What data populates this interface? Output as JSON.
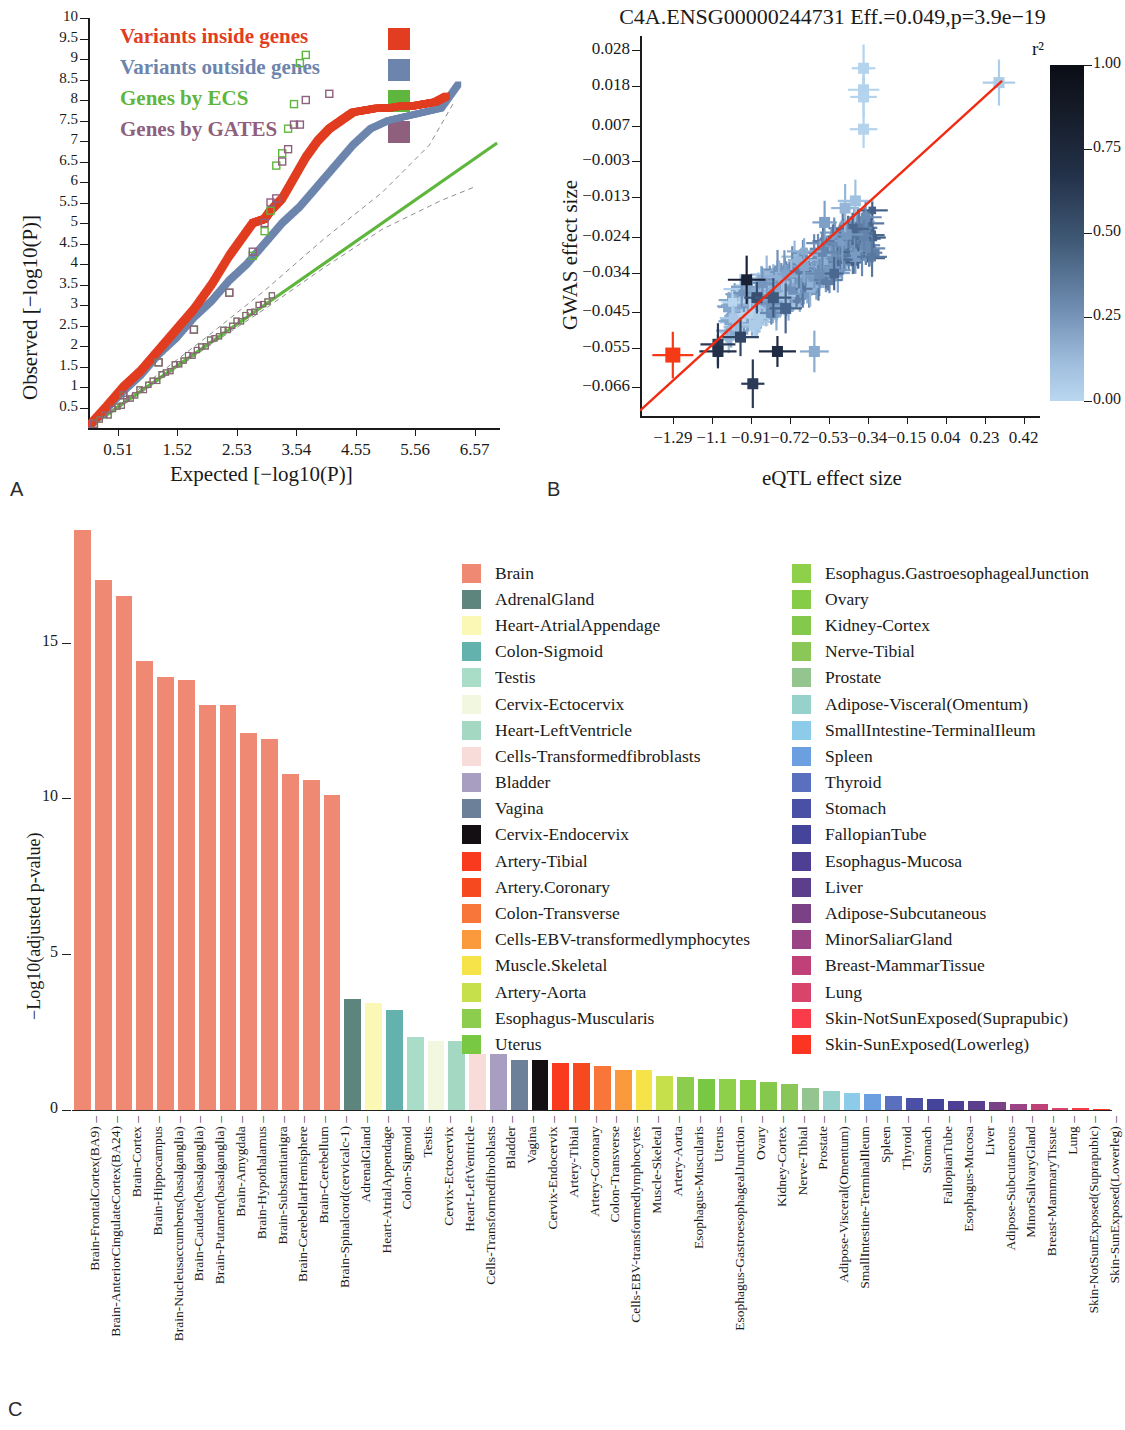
{
  "panels": {
    "a_label": "A",
    "b_label": "B",
    "c_label": "C"
  },
  "panelA": {
    "ylabel": "Observed [−log10(P)]",
    "xlabel": "Expected [−log10(P)]",
    "yticks": [
      "0.5",
      "1",
      "1.5",
      "2",
      "2.5",
      "3",
      "3.5",
      "4",
      "4.5",
      "5",
      "5.5",
      "6",
      "6.5",
      "7",
      "7.5",
      "8",
      "8.5",
      "9",
      "9.5",
      "10"
    ],
    "xticks": [
      "0.51",
      "1.52",
      "2.53",
      "3.54",
      "4.55",
      "5.56",
      "6.57"
    ],
    "legend": [
      {
        "label": "Variants inside genes",
        "color": "#e23d21"
      },
      {
        "label": "Variants outside genes",
        "color": "#6d85ad"
      },
      {
        "label": "Genes by ECS",
        "color": "#5fb63c"
      },
      {
        "label": "Genes by GATES",
        "color": "#8f5f7e"
      }
    ]
  },
  "panelB": {
    "title": "C4A.ENSG00000244731  Eff.=0.049,p=3.9e−19",
    "ylabel": "GWAS effect size",
    "xlabel": "eQTL effect size",
    "yticks": [
      "0.028",
      "0.018",
      "0.007",
      "−0.003",
      "−0.013",
      "−0.024",
      "−0.034",
      "−0.045",
      "−0.055",
      "−0.066"
    ],
    "xticks": [
      "−1.29",
      "−1.1",
      "−0.91",
      "−0.72",
      "−0.53",
      "−0.34",
      "−0.15",
      "0.04",
      "0.23",
      "0.42"
    ],
    "colorbar": {
      "title": "r²",
      "ticks": [
        "1.00",
        "0.75",
        "0.50",
        "0.25",
        "0.00"
      ]
    },
    "fit_line_color": "#f02b12",
    "highlight_point_color": "#f63a18"
  },
  "panelC": {
    "ylabel": "−Log10(adjusted p-value)",
    "yticks": [
      "0",
      "5",
      "10",
      "15"
    ],
    "legend_left": [
      {
        "label": "Brain",
        "color": "#ef8974"
      },
      {
        "label": "AdrenalGland",
        "color": "#5d857d"
      },
      {
        "label": "Heart-AtrialAppendage",
        "color": "#fbf7b5"
      },
      {
        "label": "Colon-Sigmoid",
        "color": "#63b2ae"
      },
      {
        "label": "Testis",
        "color": "#a9ddc8"
      },
      {
        "label": "Cervix-Ectocervix",
        "color": "#f2f8df"
      },
      {
        "label": "Heart-LeftVentricle",
        "color": "#a4d8c2"
      },
      {
        "label": "Cells-Transformedfibroblasts",
        "color": "#f7dcd9"
      },
      {
        "label": "Bladder",
        "color": "#a79ec2"
      },
      {
        "label": "Vagina",
        "color": "#6d8099"
      },
      {
        "label": "Cervix-Endocervix",
        "color": "#140f12"
      },
      {
        "label": "Artery-Tibial",
        "color": "#f93a1e"
      },
      {
        "label": "Artery.Coronary",
        "color": "#f74920"
      },
      {
        "label": "Colon-Transverse",
        "color": "#f9763a"
      },
      {
        "label": "Cells-EBV-transformedlymphocytes",
        "color": "#fb9a3c"
      },
      {
        "label": "Muscle.Skeletal",
        "color": "#f6e34a"
      },
      {
        "label": "Artery-Aorta",
        "color": "#c6e04c"
      },
      {
        "label": "Esophagus-Muscularis",
        "color": "#8dcd4d"
      },
      {
        "label": "Uterus",
        "color": "#79c843"
      }
    ],
    "legend_right": [
      {
        "label": "Esophagus.GastroesophagealJunction",
        "color": "#8ed04a"
      },
      {
        "label": "Ovary",
        "color": "#86cc47"
      },
      {
        "label": "Kidney-Cortex",
        "color": "#84c94c"
      },
      {
        "label": "Nerve-Tibial",
        "color": "#8ac757"
      },
      {
        "label": "Prostate",
        "color": "#95c58e"
      },
      {
        "label": "Adipose-Visceral(Omentum)",
        "color": "#96d2cb"
      },
      {
        "label": "SmallIntestine-TerminalIleum",
        "color": "#8ccbea"
      },
      {
        "label": "Spleen",
        "color": "#6b9fe0"
      },
      {
        "label": "Thyroid",
        "color": "#5a6fbd"
      },
      {
        "label": "Stomach",
        "color": "#4a50a6"
      },
      {
        "label": "FallopianTube",
        "color": "#44449a"
      },
      {
        "label": "Esophagus-Mucosa",
        "color": "#4e3f94"
      },
      {
        "label": "Liver",
        "color": "#5b3f8d"
      },
      {
        "label": "Adipose-Subcutaneous",
        "color": "#7b4187"
      },
      {
        "label": "MinorSaliarGland",
        "color": "#9a4485"
      },
      {
        "label": "Breast-MammarTissue",
        "color": "#bf4177"
      },
      {
        "label": "Lung",
        "color": "#d9456a"
      },
      {
        "label": "Skin-NotSunExposed(Suprapubic)",
        "color": "#f93b4a"
      },
      {
        "label": "Skin-SunExposed(Lowerleg)",
        "color": "#fb3522"
      }
    ],
    "bars": [
      {
        "label": "Brain-FrontalCortex(BA9)",
        "value": 18.6,
        "color": "#ef8974"
      },
      {
        "label": "Brain-AnteriorCingulateCortex(BA24)",
        "value": 17.0,
        "color": "#ef8974"
      },
      {
        "label": "Brain-Cortex",
        "value": 16.5,
        "color": "#ef8974"
      },
      {
        "label": "Brain-Hippocampus",
        "value": 14.4,
        "color": "#ef8974"
      },
      {
        "label": "Brain-Nucleusaccumbens(basalganglia)",
        "value": 13.9,
        "color": "#ef8974"
      },
      {
        "label": "Brain-Caudate(basalganglia)",
        "value": 13.8,
        "color": "#ef8974"
      },
      {
        "label": "Brain-Putamen(basalganglia)",
        "value": 13.0,
        "color": "#ef8974"
      },
      {
        "label": "Brain-Amygdala",
        "value": 13.0,
        "color": "#ef8974"
      },
      {
        "label": "Brain-Hypothalamus",
        "value": 12.1,
        "color": "#ef8974"
      },
      {
        "label": "Brain-Substantianigra",
        "value": 11.9,
        "color": "#ef8974"
      },
      {
        "label": "Brain-CerebellarHemisphere",
        "value": 10.8,
        "color": "#ef8974"
      },
      {
        "label": "Brain-Cerebellum",
        "value": 10.6,
        "color": "#ef8974"
      },
      {
        "label": "Brain-Spinalcord(cervicalc-1)",
        "value": 10.1,
        "color": "#ef8974"
      },
      {
        "label": "AdrenalGland",
        "value": 3.55,
        "color": "#5d857d"
      },
      {
        "label": "Heart-AtrialAppendage",
        "value": 3.45,
        "color": "#fbf7b5"
      },
      {
        "label": "Colon-Sigmoid",
        "value": 3.2,
        "color": "#63b2ae"
      },
      {
        "label": "Testis",
        "value": 2.35,
        "color": "#a9ddc8"
      },
      {
        "label": "Cervix-Ectocervix",
        "value": 2.2,
        "color": "#f2f8df"
      },
      {
        "label": "Heart-LeftVentricle",
        "value": 2.2,
        "color": "#a4d8c2"
      },
      {
        "label": "Cells-Transformedfibroblasts",
        "value": 1.8,
        "color": "#f7dcd9"
      },
      {
        "label": "Bladder",
        "value": 1.8,
        "color": "#a79ec2"
      },
      {
        "label": "Vagina",
        "value": 1.6,
        "color": "#6d8099"
      },
      {
        "label": "Cervix-Endocervix",
        "value": 1.6,
        "color": "#140f12"
      },
      {
        "label": "Artery-Tibial",
        "value": 1.5,
        "color": "#f93a1e"
      },
      {
        "label": "Artery-Coronary",
        "value": 1.5,
        "color": "#f74920"
      },
      {
        "label": "Colon-Transverse",
        "value": 1.4,
        "color": "#f9763a"
      },
      {
        "label": "Cells-EBV-transformedlymphocytes",
        "value": 1.3,
        "color": "#fb9a3c"
      },
      {
        "label": "Muscle-Skeletal",
        "value": 1.3,
        "color": "#f6e34a"
      },
      {
        "label": "Artery-Aorta",
        "value": 1.1,
        "color": "#c6e04c"
      },
      {
        "label": "Esophagus-Muscularis",
        "value": 1.05,
        "color": "#8dcd4d"
      },
      {
        "label": "Uterus",
        "value": 1.0,
        "color": "#79c843"
      },
      {
        "label": "Esophagus-GastroesophagealJunction",
        "value": 1.0,
        "color": "#8ed04a"
      },
      {
        "label": "Ovary",
        "value": 0.95,
        "color": "#86cc47"
      },
      {
        "label": "Kidney-Cortex",
        "value": 0.9,
        "color": "#84c94c"
      },
      {
        "label": "Nerve-Tibial",
        "value": 0.85,
        "color": "#8ac757"
      },
      {
        "label": "Prostate",
        "value": 0.7,
        "color": "#95c58e"
      },
      {
        "label": "Adipose-Visceral(Omentum)",
        "value": 0.6,
        "color": "#96d2cb"
      },
      {
        "label": "SmallIntestine-TerminalIleum",
        "value": 0.55,
        "color": "#8ccbea"
      },
      {
        "label": "Spleen",
        "value": 0.5,
        "color": "#6b9fe0"
      },
      {
        "label": "Thyroid",
        "value": 0.45,
        "color": "#5a6fbd"
      },
      {
        "label": "Stomach",
        "value": 0.4,
        "color": "#4a50a6"
      },
      {
        "label": "FallopianTube",
        "value": 0.35,
        "color": "#44449a"
      },
      {
        "label": "Esophagus-Mucosa",
        "value": 0.3,
        "color": "#4e3f94"
      },
      {
        "label": "Liver",
        "value": 0.28,
        "color": "#5b3f8d"
      },
      {
        "label": "Adipose-Subcutaneous",
        "value": 0.25,
        "color": "#7b4187"
      },
      {
        "label": "MinorSalivaryGland",
        "value": 0.2,
        "color": "#9a4485"
      },
      {
        "label": "Breast-MammaryTissue",
        "value": 0.18,
        "color": "#bf4177"
      },
      {
        "label": "Lung",
        "value": 0.08,
        "color": "#d9456a"
      },
      {
        "label": "Skin-NotSunExposed(Suprapubic)",
        "value": 0.05,
        "color": "#f93b4a"
      },
      {
        "label": "Skin-SunExposed(Lowerleg)",
        "value": 0.03,
        "color": "#fb3522"
      }
    ]
  },
  "chart_data": [
    {
      "type": "scatter",
      "name": "qq-plot",
      "title": "",
      "xlabel": "Expected [-log10(P)]",
      "ylabel": "Observed [-log10(P)]",
      "xlim": [
        0,
        7.0
      ],
      "ylim": [
        0,
        10
      ],
      "grid": false,
      "legend_position": "top-left",
      "series": [
        {
          "name": "Variants inside genes",
          "color": "#e23d21",
          "x": [
            0.05,
            0.3,
            0.6,
            0.9,
            1.2,
            1.5,
            1.8,
            2.1,
            2.4,
            2.6,
            2.8,
            2.9,
            3.0,
            3.1,
            3.3,
            3.5,
            3.7,
            3.9,
            4.1,
            4.3,
            4.5,
            4.7,
            4.9,
            5.1,
            5.3,
            5.5,
            5.7,
            5.9,
            6.1
          ],
          "y": [
            0.1,
            0.5,
            1.0,
            1.4,
            1.9,
            2.4,
            2.9,
            3.5,
            4.2,
            4.6,
            5.0,
            5.05,
            5.1,
            5.3,
            5.6,
            6.1,
            6.6,
            7.0,
            7.3,
            7.5,
            7.7,
            7.75,
            7.8,
            7.8,
            7.85,
            7.85,
            7.9,
            7.95,
            8.1
          ]
        },
        {
          "name": "Variants outside genes",
          "color": "#6d85ad",
          "x": [
            0.05,
            0.3,
            0.6,
            0.9,
            1.2,
            1.5,
            1.8,
            2.1,
            2.4,
            2.7,
            3.0,
            3.3,
            3.6,
            3.9,
            4.2,
            4.5,
            4.8,
            5.1,
            5.4,
            5.7,
            6.0,
            6.3
          ],
          "y": [
            0.08,
            0.45,
            0.9,
            1.3,
            1.8,
            2.2,
            2.7,
            3.1,
            3.6,
            4.0,
            4.5,
            5.0,
            5.4,
            5.9,
            6.4,
            6.9,
            7.3,
            7.5,
            7.6,
            7.7,
            7.8,
            8.4
          ]
        },
        {
          "name": "Genes by ECS",
          "color": "#5fb63c",
          "x": [
            0.1,
            0.6,
            1.2,
            1.8,
            2.4,
            2.8,
            3.0,
            3.1,
            3.2,
            3.3,
            3.4,
            3.5,
            3.6,
            3.7
          ],
          "y": [
            0.1,
            0.8,
            1.6,
            2.4,
            3.3,
            4.2,
            4.8,
            5.3,
            6.4,
            6.7,
            7.3,
            7.9,
            8.9,
            9.1
          ]
        },
        {
          "name": "Genes by GATES",
          "color": "#8f5f7e",
          "x": [
            0.1,
            0.6,
            1.2,
            1.8,
            2.4,
            2.8,
            3.0,
            3.1,
            3.2,
            3.3,
            3.4,
            3.5,
            3.6,
            3.7,
            4.1
          ],
          "y": [
            0.1,
            0.8,
            1.6,
            2.4,
            3.3,
            4.3,
            5.0,
            5.5,
            5.6,
            6.5,
            6.8,
            7.4,
            7.4,
            8.0,
            8.15
          ]
        }
      ]
    },
    {
      "type": "scatter",
      "name": "eqtl-gwas-effect-size",
      "title": "C4A.ENSG00000244731  Eff.=0.049,p=3.9e-19",
      "xlabel": "eQTL effect size",
      "ylabel": "GWAS effect size",
      "xlim": [
        -1.45,
        0.5
      ],
      "ylim": [
        -0.074,
        0.032
      ],
      "colorbar": {
        "label": "r^2",
        "min": 0.0,
        "max": 1.0,
        "ticks": [
          0.0,
          0.25,
          0.5,
          0.75,
          1.0
        ]
      },
      "grid": false,
      "annotations": [
        "red fitted regression line through origin cluster"
      ],
      "points": [
        {
          "x": -1.29,
          "y": -0.057,
          "r2": 1.0,
          "highlight": true
        },
        {
          "x": -0.36,
          "y": 0.023,
          "r2": 0.02
        },
        {
          "x": -0.36,
          "y": 0.017,
          "r2": 0.02
        },
        {
          "x": -0.36,
          "y": 0.015,
          "r2": 0.02
        },
        {
          "x": -0.36,
          "y": 0.006,
          "r2": 0.02
        },
        {
          "x": 0.3,
          "y": 0.019,
          "r2": 0.05
        },
        {
          "x": -0.93,
          "y": -0.036,
          "r2": 0.85
        },
        {
          "x": -0.88,
          "y": -0.041,
          "r2": 0.6
        },
        {
          "x": -0.8,
          "y": -0.041,
          "r2": 0.55
        },
        {
          "x": -0.74,
          "y": -0.044,
          "r2": 0.5
        },
        {
          "x": -1.07,
          "y": -0.054,
          "r2": 0.7
        },
        {
          "x": -1.07,
          "y": -0.056,
          "r2": 0.75
        },
        {
          "x": -0.96,
          "y": -0.052,
          "r2": 0.65
        },
        {
          "x": -0.9,
          "y": -0.065,
          "r2": 0.7
        },
        {
          "x": -0.78,
          "y": -0.056,
          "r2": 0.78
        },
        {
          "x": -0.6,
          "y": -0.056,
          "r2": 0.2
        },
        {
          "x": -0.55,
          "y": -0.02,
          "r2": 0.25
        },
        {
          "x": -0.45,
          "y": -0.016,
          "r2": 0.15
        },
        {
          "x": -0.4,
          "y": -0.014,
          "r2": 0.1
        }
      ]
    },
    {
      "type": "bar",
      "name": "tissue-enrichment",
      "title": "",
      "xlabel": "",
      "ylabel": "-Log10(adjusted p-value)",
      "ylim": [
        0,
        19
      ],
      "grid": false,
      "legend_position": "top-center",
      "categories": [
        "Brain-FrontalCortex(BA9)",
        "Brain-AnteriorCingulateCortex(BA24)",
        "Brain-Cortex",
        "Brain-Hippocampus",
        "Brain-Nucleusaccumbens(basalganglia)",
        "Brain-Caudate(basalganglia)",
        "Brain-Putamen(basalganglia)",
        "Brain-Amygdala",
        "Brain-Hypothalamus",
        "Brain-Substantianigra",
        "Brain-CerebellarHemisphere",
        "Brain-Cerebellum",
        "Brain-Spinalcord(cervicalc-1)",
        "AdrenalGland",
        "Heart-AtrialAppendage",
        "Colon-Sigmoid",
        "Testis",
        "Cervix-Ectocervix",
        "Heart-LeftVentricle",
        "Cells-Transformedfibroblasts",
        "Bladder",
        "Vagina",
        "Cervix-Endocervix",
        "Artery-Tibial",
        "Artery-Coronary",
        "Colon-Transverse",
        "Cells-EBV-transformedlymphocytes",
        "Muscle-Skeletal",
        "Artery-Aorta",
        "Esophagus-Muscularis",
        "Uterus",
        "Esophagus-GastroesophagealJunction",
        "Ovary",
        "Kidney-Cortex",
        "Nerve-Tibial",
        "Prostate",
        "Adipose-Visceral(Omentum)",
        "SmallIntestine-TerminalIleum",
        "Spleen",
        "Thyroid",
        "Stomach",
        "FallopianTube",
        "Esophagus-Mucosa",
        "Liver",
        "Adipose-Subcutaneous",
        "MinorSalivaryGland",
        "Breast-MammaryTissue",
        "Lung",
        "Skin-NotSunExposed(Suprapubic)",
        "Skin-SunExposed(Lowerleg)"
      ],
      "values": [
        18.6,
        17.0,
        16.5,
        14.4,
        13.9,
        13.8,
        13.0,
        13.0,
        12.1,
        11.9,
        10.8,
        10.6,
        10.1,
        3.55,
        3.45,
        3.2,
        2.35,
        2.2,
        2.2,
        1.8,
        1.8,
        1.6,
        1.6,
        1.5,
        1.5,
        1.4,
        1.3,
        1.3,
        1.1,
        1.05,
        1.0,
        1.0,
        0.95,
        0.9,
        0.85,
        0.7,
        0.6,
        0.55,
        0.5,
        0.45,
        0.4,
        0.35,
        0.3,
        0.28,
        0.25,
        0.2,
        0.18,
        0.08,
        0.05,
        0.03
      ]
    }
  ]
}
